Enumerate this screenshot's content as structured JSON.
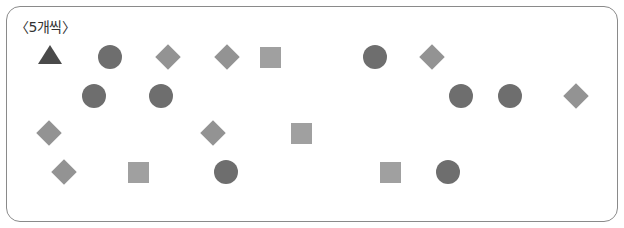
{
  "label": "〈5개씩〉",
  "colors": {
    "circle": "#6e6e6e",
    "square": "#a0a0a0",
    "diamond": "#939393",
    "triangle": "#4a4a4a",
    "border": "#8a8a8a"
  },
  "shapes": [
    {
      "type": "triangle",
      "x": 50,
      "y": 55
    },
    {
      "type": "circle",
      "x": 110,
      "y": 57
    },
    {
      "type": "diamond",
      "x": 168,
      "y": 57
    },
    {
      "type": "diamond",
      "x": 227,
      "y": 57
    },
    {
      "type": "square",
      "x": 270,
      "y": 57
    },
    {
      "type": "circle",
      "x": 375,
      "y": 57
    },
    {
      "type": "diamond",
      "x": 432,
      "y": 57
    },
    {
      "type": "circle",
      "x": 94,
      "y": 96
    },
    {
      "type": "circle",
      "x": 161,
      "y": 96
    },
    {
      "type": "circle",
      "x": 461,
      "y": 96
    },
    {
      "type": "circle",
      "x": 510,
      "y": 96
    },
    {
      "type": "diamond",
      "x": 576,
      "y": 96
    },
    {
      "type": "diamond",
      "x": 49,
      "y": 133
    },
    {
      "type": "diamond",
      "x": 213,
      "y": 133
    },
    {
      "type": "square",
      "x": 301,
      "y": 133
    },
    {
      "type": "diamond",
      "x": 64,
      "y": 172
    },
    {
      "type": "square",
      "x": 138,
      "y": 172
    },
    {
      "type": "circle",
      "x": 226,
      "y": 172
    },
    {
      "type": "square",
      "x": 390,
      "y": 172
    },
    {
      "type": "circle",
      "x": 448,
      "y": 172
    }
  ]
}
